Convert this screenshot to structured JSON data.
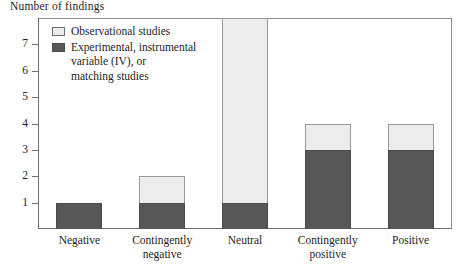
{
  "chart_data": {
    "type": "bar",
    "title": "Number of findings",
    "xlabel": "",
    "ylabel": "Number of findings",
    "ylim": [
      0,
      8
    ],
    "yticks": [
      1,
      2,
      3,
      4,
      5,
      6,
      7
    ],
    "grid": false,
    "stacked": true,
    "legend_position": "top-left",
    "categories": [
      "Negative",
      "Contingently negative",
      "Neutral",
      "Contingently positive",
      "Positive"
    ],
    "category_lines": [
      [
        "Negative"
      ],
      [
        "Contingently",
        "negative"
      ],
      [
        "Neutral"
      ],
      [
        "Contingently",
        "positive"
      ],
      [
        "Positive"
      ]
    ],
    "series": [
      {
        "name": "Experimental, instrumental variable (IV), or matching studies",
        "short_name": "Experimental/IV/matching",
        "color": "#575757",
        "values": [
          1,
          1,
          1,
          3,
          3
        ]
      },
      {
        "name": "Observational studies",
        "short_name": "Observational",
        "color": "#ececec",
        "values": [
          0,
          1,
          7,
          1,
          1
        ]
      }
    ],
    "totals": [
      1,
      2,
      8,
      4,
      4
    ]
  },
  "legend": {
    "items": [
      {
        "swatch": "light",
        "lines": [
          "Observational studies"
        ]
      },
      {
        "swatch": "dark",
        "lines": [
          "Experimental, instrumental",
          "variable (IV), or",
          "matching studies"
        ]
      }
    ]
  },
  "colors": {
    "dark_fill": "#575757",
    "light_fill": "#ececec",
    "frame": "#8d8d8d",
    "axis": "#6f6f6f",
    "text": "#1e1e1e",
    "background": "#ffffff"
  }
}
